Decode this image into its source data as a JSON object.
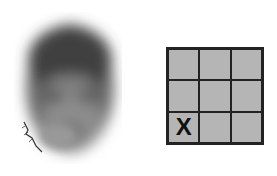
{
  "stimulus": {
    "face": {
      "description": "blurred grayscale face image"
    },
    "grid": {
      "rows": 3,
      "cols": 3,
      "cells": [
        "",
        "",
        "",
        "",
        "",
        "",
        "X",
        "",
        ""
      ],
      "marked_cell": {
        "row": 3,
        "col": 1,
        "mark": "X"
      }
    }
  },
  "colors": {
    "background": "#ffffff",
    "cell_fill": "#b5b5b5",
    "grid_lines": "#222222",
    "mark": "#111111"
  }
}
